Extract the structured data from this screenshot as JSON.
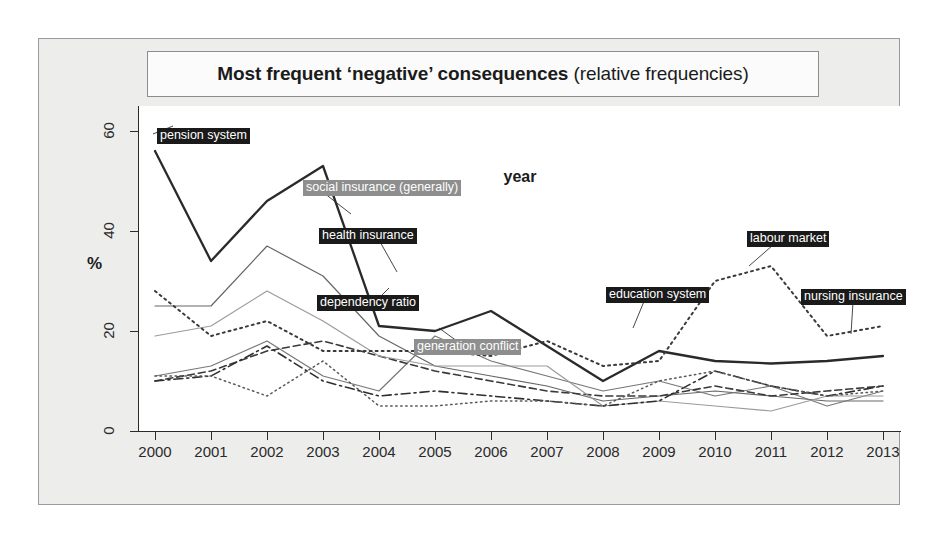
{
  "title": {
    "strong": "Most frequent ‘negative’ consequences",
    "normal": " (relative frequencies)"
  },
  "axes": {
    "y_label": "%",
    "x_label": "year",
    "y_ticks": [
      "0",
      "20",
      "40",
      "60"
    ],
    "x_ticks": [
      "2000",
      "2001",
      "2002",
      "2003",
      "2004",
      "2005",
      "2006",
      "2007",
      "2008",
      "2009",
      "2010",
      "2011",
      "2012",
      "2013"
    ]
  },
  "labels": {
    "pension_system": "pension system",
    "social_insurance": "social insurance (generally)",
    "health_insurance": "health insurance",
    "dependency_ratio": "dependency ratio",
    "generation_conflict": "generation conflict",
    "education_system": "education system",
    "labour_market": "labour market",
    "nursing_insurance": "nursing insurance"
  },
  "colors": {
    "frame_bg": "#ededec",
    "plot_bg": "#ffffff",
    "axis": "#2b2b2b",
    "label_dark": "#1a1a1a",
    "label_gray": "#8e8e8e"
  },
  "chart_data": {
    "type": "line",
    "title": "Most frequent ‘negative’ consequences (relative frequencies)",
    "xlabel": "year",
    "ylabel": "%",
    "xlim": [
      2000,
      2013
    ],
    "ylim": [
      0,
      65
    ],
    "grid": false,
    "legend": "inline-labels",
    "x": [
      2000,
      2001,
      2002,
      2003,
      2004,
      2005,
      2006,
      2007,
      2008,
      2009,
      2010,
      2011,
      2012,
      2013
    ],
    "series": [
      {
        "name": "pension system",
        "style": "solid-thick",
        "color": "#2a2a2a",
        "values": [
          56,
          34,
          46,
          53,
          21,
          20,
          24,
          17,
          10,
          16,
          14,
          13.5,
          14,
          15
        ]
      },
      {
        "name": "social insurance (generally)",
        "style": "solid-thin",
        "color": "#666666",
        "values": [
          25,
          25,
          37,
          31,
          19,
          13,
          11,
          9,
          6,
          7,
          8,
          7,
          6,
          6
        ]
      },
      {
        "name": "health insurance",
        "style": "solid-thin",
        "color": "#777777",
        "values": [
          11,
          13,
          18,
          11,
          8,
          19,
          14,
          11,
          8,
          10,
          7,
          9,
          5,
          8
        ]
      },
      {
        "name": "dependency ratio",
        "style": "dashed",
        "color": "#3a3a3a",
        "values": [
          10,
          12,
          16,
          18,
          15,
          12,
          10,
          8,
          7,
          7,
          9,
          7,
          8,
          9
        ]
      },
      {
        "name": "generation conflict",
        "style": "solid-gray",
        "color": "#9b9b9b",
        "values": [
          19,
          21,
          28,
          22,
          15,
          13,
          13,
          13,
          5,
          6,
          5,
          4,
          7,
          7
        ]
      },
      {
        "name": "education system",
        "style": "dash-dot",
        "color": "#2f2f2f",
        "values": [
          10,
          11,
          17,
          10,
          7,
          8,
          7,
          6,
          5,
          6,
          12,
          9,
          7,
          9
        ]
      },
      {
        "name": "labour market",
        "style": "dotted",
        "color": "#3a3a3a",
        "values": [
          28,
          19,
          22,
          16,
          16,
          16,
          15,
          18,
          13,
          14,
          30,
          33,
          19,
          21
        ]
      },
      {
        "name": "nursing insurance",
        "style": "dotted-fine",
        "color": "#5a5a5a",
        "values": [
          11,
          11,
          7,
          14,
          5,
          5,
          6,
          6,
          5,
          10,
          12,
          9,
          7,
          8
        ]
      }
    ]
  }
}
